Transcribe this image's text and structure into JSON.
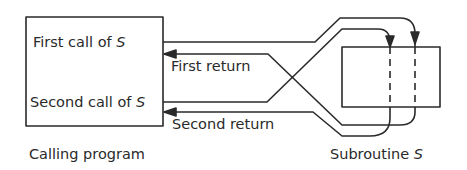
{
  "calling_program": {
    "label": "Calling program",
    "first_call_text": "First call of ",
    "second_call_text": "Second call of ",
    "var": "S"
  },
  "returns": {
    "first": "First return",
    "second": "Second return"
  },
  "subroutine": {
    "label_text": "Subroutine ",
    "var": "S"
  },
  "colors": {
    "stroke": "#2a2a2a",
    "background": "#ffffff"
  }
}
